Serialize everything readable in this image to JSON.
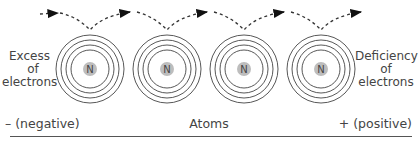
{
  "diagram": {
    "left_label": [
      "Excess",
      "of",
      "electrons"
    ],
    "right_label": [
      "Deficiency",
      "of",
      "electrons"
    ],
    "nucleus_label": "N",
    "atom_count": 4,
    "bottom_labels": {
      "negative": "– (negative)",
      "center": "Atoms",
      "positive": "+ (positive)"
    },
    "colors": {
      "line": "#444444",
      "nucleus": "#bdbdbd",
      "arrow": "#111111"
    }
  }
}
